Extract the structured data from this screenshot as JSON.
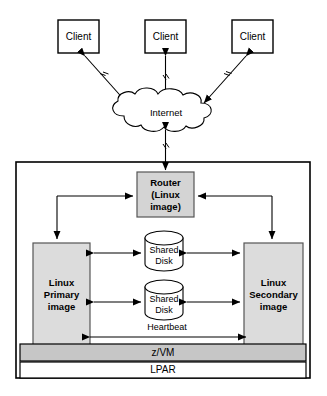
{
  "diagram": {
    "clients": [
      {
        "id": "client-left",
        "label": "Client"
      },
      {
        "id": "client-center",
        "label": "Client"
      },
      {
        "id": "client-right",
        "label": "Client"
      }
    ],
    "network": {
      "cloud_label": "Internet"
    },
    "router": {
      "line1": "Router",
      "line2": "(Linux",
      "line3": "image)"
    },
    "nodes": [
      {
        "id": "linux-primary",
        "line1": "Linux",
        "line2": "Primary",
        "line3": "image"
      },
      {
        "id": "linux-secondary",
        "line1": "Linux",
        "line2": "Secondary",
        "line3": "image"
      }
    ],
    "disks": [
      {
        "id": "shared-disk-1",
        "line1": "Shared",
        "line2": "Disk"
      },
      {
        "id": "shared-disk-2",
        "line1": "Shared",
        "line2": "Disk"
      }
    ],
    "links": {
      "heartbeat_label": "Heartbeat"
    },
    "bands": [
      {
        "id": "zvm",
        "label": "z/VM"
      },
      {
        "id": "lpar",
        "label": "LPAR"
      }
    ],
    "colors": {
      "outline": "#000000",
      "router_fill": "#d4d4d4",
      "node_fill": "#dcdcdc",
      "zvm_fill": "#c6c6c6",
      "lpar_fill": "#ffffff",
      "canvas": "#ffffff"
    }
  }
}
